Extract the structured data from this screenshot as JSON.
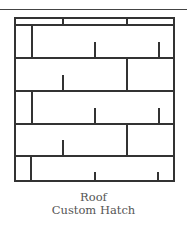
{
  "caption": {
    "title": "Roof",
    "subtitle": "Custom Hatch"
  },
  "colors": {
    "line": "#333333",
    "text": "#555555",
    "background": "#ffffff"
  },
  "hatch": {
    "box": {
      "x": 15,
      "y": 18,
      "width": 159,
      "height": 163
    },
    "rows_y": [
      18,
      25,
      58,
      91,
      124,
      156,
      181
    ]
  }
}
